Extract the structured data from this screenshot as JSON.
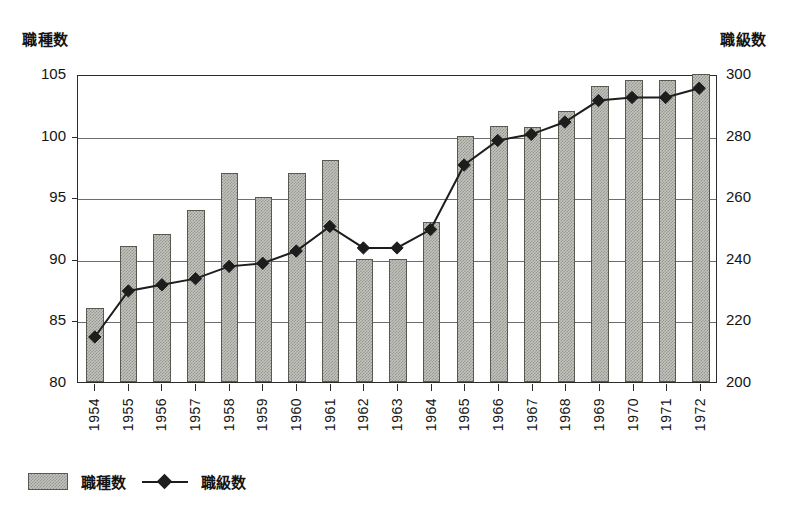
{
  "axis_titles": {
    "left": "職種数",
    "right": "職級数"
  },
  "legend": {
    "bar_label": "職種数",
    "line_label": "職級数",
    "bar_icon": "gray-bar-swatch",
    "line_icon": "diamond-marker-line"
  },
  "colors": {
    "bar_fill": "#c3c3bd",
    "bar_border": "#595952",
    "line": "#1d1d1d",
    "marker": "#1d1d1d",
    "grid": "#6d6d6d",
    "frame": "#2b2b2b",
    "background": "#ffffff",
    "text": "#141414"
  },
  "chart_data": {
    "type": "bar",
    "title": "",
    "subtitle": "",
    "xlabel": "",
    "ylabel": "職種数",
    "y2label": "職級数",
    "ylim": [
      80,
      105
    ],
    "y2lim": [
      200,
      300
    ],
    "yticks": [
      80,
      85,
      90,
      95,
      100,
      105
    ],
    "y2ticks": [
      200,
      220,
      240,
      260,
      280,
      300
    ],
    "grid": true,
    "legend_position": "bottom-left",
    "categories": [
      "1954",
      "1955",
      "1956",
      "1957",
      "1958",
      "1959",
      "1960",
      "1961",
      "1962",
      "1963",
      "1964",
      "1965",
      "1966",
      "1967",
      "1968",
      "1969",
      "1970",
      "1971",
      "1972"
    ],
    "series": [
      {
        "name": "職種数",
        "type": "bar",
        "axis": "left",
        "values": [
          86,
          91,
          92,
          94,
          97,
          95,
          97,
          98,
          90,
          90,
          93,
          100,
          100.8,
          100.7,
          102,
          104,
          104.5,
          104.5,
          105
        ]
      },
      {
        "name": "職級数",
        "type": "line",
        "axis": "right",
        "marker": "diamond",
        "values": [
          215,
          230,
          232,
          234,
          238,
          239,
          243,
          251,
          244,
          244,
          250,
          271,
          279,
          281,
          285,
          292,
          293,
          293,
          296
        ]
      }
    ]
  }
}
